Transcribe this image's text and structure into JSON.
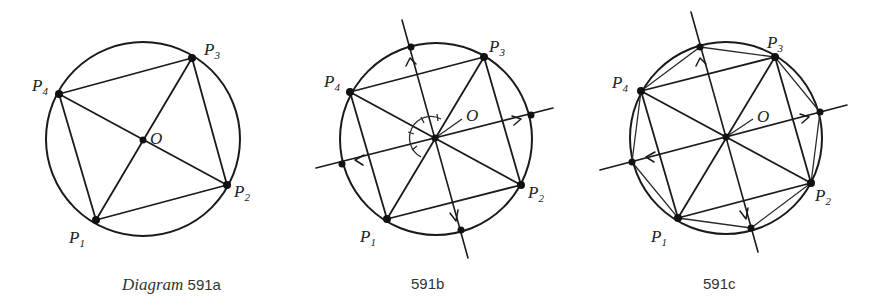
{
  "figure": {
    "panels": [
      {
        "id": "a",
        "caption_prefix": "Diagram",
        "caption": "591a",
        "center_label": "O",
        "vertex_labels": [
          "P",
          "P",
          "P",
          "P"
        ],
        "vertex_subscripts": [
          "1",
          "2",
          "3",
          "4"
        ]
      },
      {
        "id": "b",
        "caption_prefix": "",
        "caption": "591b",
        "center_label": "O",
        "vertex_labels": [
          "P",
          "P",
          "P",
          "P"
        ],
        "vertex_subscripts": [
          "1",
          "2",
          "3",
          "4"
        ]
      },
      {
        "id": "c",
        "caption_prefix": "",
        "caption": "591c",
        "center_label": "O",
        "vertex_labels": [
          "P",
          "P",
          "P",
          "P"
        ],
        "vertex_subscripts": [
          "1",
          "2",
          "3",
          "4"
        ]
      }
    ],
    "colors": {
      "ink": "#1a1a1a",
      "background": "#ffffff"
    }
  }
}
